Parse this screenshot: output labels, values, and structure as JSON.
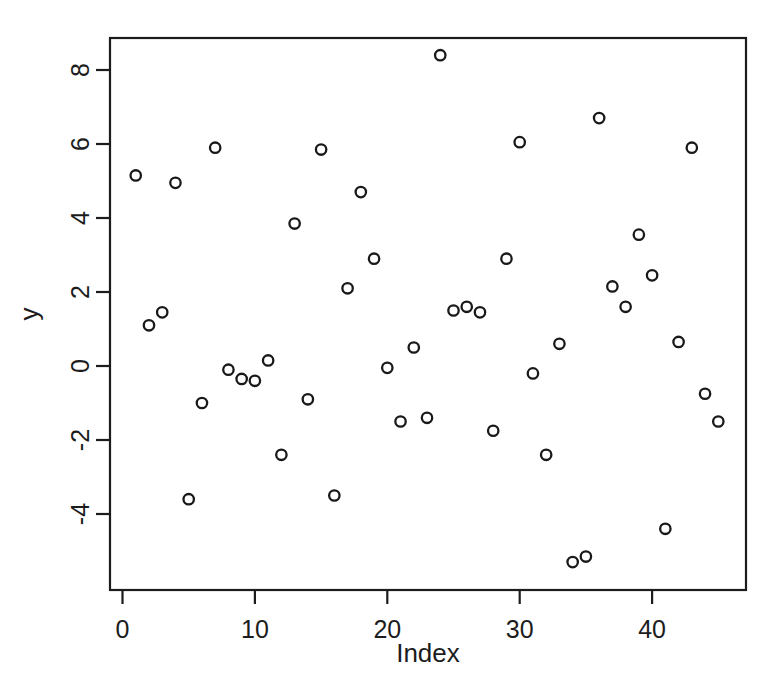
{
  "chart_data": {
    "type": "scatter",
    "title": "",
    "xlabel": "Index",
    "ylabel": "y",
    "xlim": [
      0,
      46
    ],
    "ylim": [
      -5.6,
      8.6
    ],
    "xticks": [
      0,
      10,
      20,
      30,
      40
    ],
    "yticks": [
      8,
      6,
      4,
      2,
      0,
      -2,
      -4
    ],
    "grid": false,
    "legend": null,
    "marker": "open-circle",
    "marker_color": "#191919",
    "x": [
      1,
      2,
      3,
      4,
      5,
      6,
      7,
      8,
      9,
      10,
      11,
      12,
      13,
      14,
      15,
      16,
      17,
      18,
      19,
      20,
      21,
      22,
      23,
      24,
      25,
      26,
      27,
      28,
      29,
      30,
      31,
      32,
      33,
      34,
      35,
      36,
      37,
      38,
      39,
      40,
      41,
      42,
      43,
      44,
      45
    ],
    "y": [
      5.15,
      1.1,
      1.45,
      4.95,
      -3.6,
      -1.0,
      5.9,
      -0.1,
      -0.35,
      -0.4,
      0.15,
      -2.4,
      3.85,
      -0.9,
      5.85,
      -3.5,
      2.1,
      4.7,
      2.9,
      -0.05,
      -1.5,
      0.5,
      -1.4,
      8.4,
      1.5,
      1.6,
      1.45,
      -1.75,
      2.9,
      6.05,
      -0.2,
      -2.4,
      0.6,
      -5.3,
      -5.15,
      6.7,
      2.15,
      1.6,
      3.55,
      2.45,
      -4.4,
      0.65,
      5.9,
      -0.75,
      -1.5
    ],
    "n_points": 45,
    "xtick_labels": [
      "0",
      "10",
      "20",
      "30",
      "40"
    ],
    "ytick_labels": [
      "8",
      "6",
      "4",
      "2",
      "0",
      "-2",
      "-4"
    ]
  },
  "axes": {
    "x_title": "Index",
    "y_title": "y"
  }
}
